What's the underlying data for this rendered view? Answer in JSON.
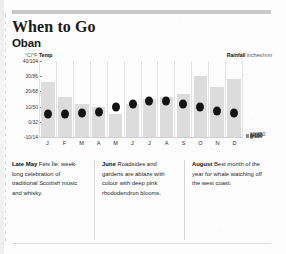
{
  "header": {
    "title": "When to Go",
    "subtitle": "Oban"
  },
  "chart_data": {
    "type": "bar",
    "categories": [
      "J",
      "F",
      "M",
      "A",
      "M",
      "J",
      "J",
      "A",
      "S",
      "O",
      "N",
      "D"
    ],
    "month_names": [
      "January",
      "February",
      "March",
      "April",
      "May",
      "June",
      "July",
      "August",
      "September",
      "October",
      "November",
      "December"
    ],
    "grid": true,
    "legend": "none",
    "left_axis": {
      "label": "Temp",
      "unit": "°C/°F",
      "ticks": [
        "40/104",
        "30/86",
        "20/68",
        "10/50",
        "0/32",
        "-10/14"
      ],
      "values_c": [
        40,
        30,
        20,
        10,
        0,
        -10
      ],
      "values_f": [
        104,
        86,
        68,
        50,
        32,
        14
      ],
      "ylim": [
        -10,
        40
      ]
    },
    "right_axis": {
      "label": "Rainfall",
      "unit": "inches/mm",
      "ticks": [
        "10/250",
        "8/200",
        "6/150",
        "4/100",
        "2/50",
        "0"
      ],
      "values_in": [
        10,
        8,
        6,
        4,
        2,
        0
      ],
      "values_mm": [
        250,
        200,
        150,
        100,
        50,
        0
      ],
      "ylim": [
        0,
        250
      ]
    },
    "series": [
      {
        "name": "Rainfall",
        "type": "bar",
        "unit": "mm",
        "values": [
          180,
          130,
          110,
          100,
          75,
          110,
          125,
          130,
          140,
          200,
          165,
          190
        ]
      },
      {
        "name": "Temperature",
        "type": "scatter",
        "unit": "°C",
        "values": [
          5,
          5,
          6,
          6.5,
          9.5,
          11.5,
          13.5,
          13.5,
          12,
          9.5,
          7,
          5.5
        ]
      }
    ]
  },
  "captions": [
    {
      "month": "Late May",
      "text": " Fèis Ìle: week-long celebration of traditional Scottish music and whisky."
    },
    {
      "month": "June",
      "text": " Roadsides and gardens are ablaze with colour with deep pink rhododendron blooms."
    },
    {
      "month": "August",
      "text": " Best month of the year for whale watching off the west coast."
    }
  ]
}
